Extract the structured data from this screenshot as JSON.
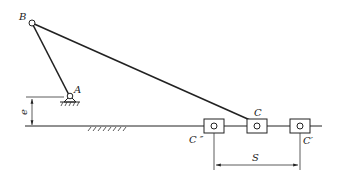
{
  "diagram": {
    "type": "offset slider-crank mechanism",
    "labels": {
      "B": "B",
      "A": "A",
      "C": "C",
      "C_double_prime": "C ″",
      "C_prime": "C′",
      "e": "e",
      "S": "S"
    },
    "components": [
      {
        "id": "crank",
        "from": "A",
        "to": "B",
        "desc": "crank link"
      },
      {
        "id": "coupler",
        "from": "B",
        "to": "C",
        "desc": "connecting rod"
      },
      {
        "id": "slider",
        "positions": [
          "C″",
          "C",
          "C′"
        ],
        "desc": "slider on guide"
      },
      {
        "id": "ground-pivot",
        "at": "A",
        "desc": "fixed hinge support"
      },
      {
        "id": "guide-ground",
        "desc": "hatched ground guide line"
      }
    ],
    "dimensions": [
      {
        "symbol": "e",
        "meaning": "offset between pivot A and slider guide"
      },
      {
        "symbol": "S",
        "meaning": "slider stroke between C″ and C′"
      }
    ],
    "colors": {
      "line": "#222222",
      "background": "#ffffff"
    }
  }
}
